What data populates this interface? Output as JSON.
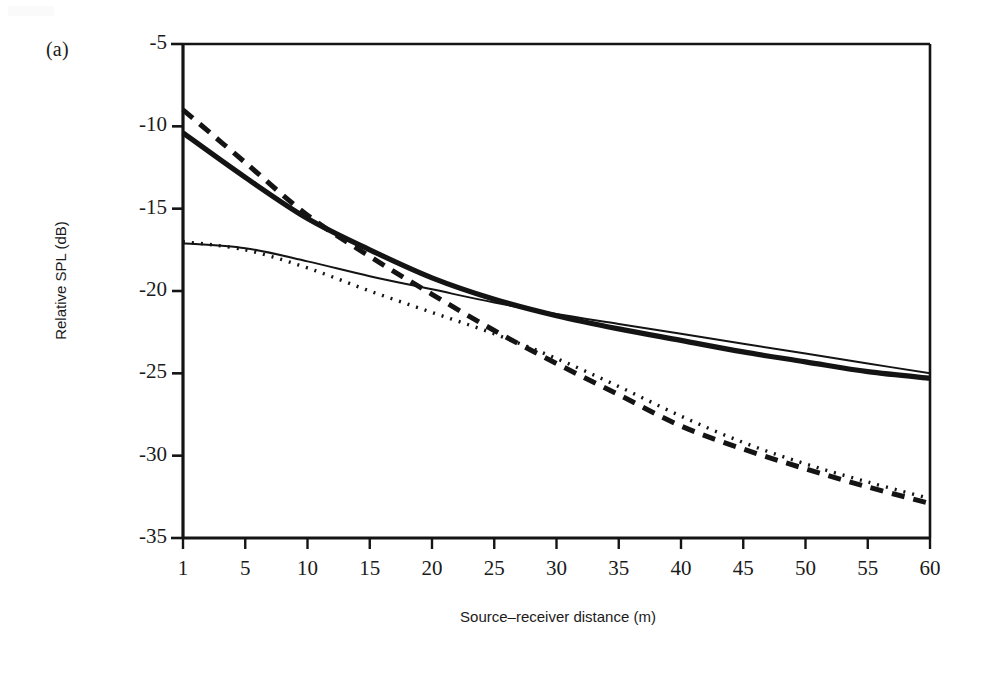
{
  "figure": {
    "panel_label": "(a)",
    "background_color": "#ffffff",
    "ink_color": "#141414"
  },
  "axes": {
    "x_title": "Source–receiver distance (m)",
    "y_title": "Relative SPL (dB)",
    "x_tick_labels": [
      "1",
      "5",
      "10",
      "15",
      "20",
      "25",
      "30",
      "35",
      "40",
      "45",
      "50",
      "55",
      "60"
    ],
    "y_tick_labels": [
      "-5",
      "-10",
      "-15",
      "-20",
      "-25",
      "-30",
      "-35"
    ]
  },
  "chart_data": {
    "type": "line",
    "title": "",
    "subtitle": "",
    "panel": "(a)",
    "xlabel": "Source–receiver distance (m)",
    "ylabel": "Relative SPL (dB)",
    "x_scale": "categorical-even-spacing",
    "categories": [
      1,
      5,
      10,
      15,
      20,
      25,
      30,
      35,
      40,
      45,
      50,
      55,
      60
    ],
    "ylim": [
      -35,
      -5
    ],
    "y_ticks": [
      -5,
      -10,
      -15,
      -20,
      -25,
      -30,
      -35
    ],
    "grid": false,
    "legend": "none",
    "annotations": [],
    "series": [
      {
        "name": "thick-solid",
        "style": "solid",
        "width": "thick",
        "color": "#141414",
        "values": [
          -10.4,
          -13.1,
          -15.6,
          -17.5,
          -19.2,
          -20.5,
          -21.5,
          -22.3,
          -23.0,
          -23.7,
          -24.3,
          -24.9,
          -25.3
        ]
      },
      {
        "name": "thick-dashed",
        "style": "dashed",
        "width": "thick",
        "color": "#141414",
        "values": [
          -9.0,
          -12.2,
          -15.4,
          -17.9,
          -20.2,
          -22.4,
          -24.4,
          -26.3,
          -28.2,
          -29.6,
          -30.8,
          -31.9,
          -32.9
        ]
      },
      {
        "name": "thin-solid",
        "style": "solid",
        "width": "thin",
        "color": "#141414",
        "values": [
          -17.1,
          -17.4,
          -18.2,
          -19.1,
          -19.9,
          -20.7,
          -21.4,
          -22.0,
          -22.6,
          -23.2,
          -23.8,
          -24.4,
          -25.0
        ]
      },
      {
        "name": "thin-dotted",
        "style": "dotted",
        "width": "thin",
        "color": "#141414",
        "values": [
          -17.0,
          -17.5,
          -18.6,
          -20.0,
          -21.3,
          -22.6,
          -24.1,
          -25.8,
          -27.6,
          -29.2,
          -30.5,
          -31.6,
          -32.6
        ]
      }
    ]
  },
  "plot_geometry": {
    "left": 183,
    "right": 930,
    "top": 44,
    "bottom": 538
  }
}
